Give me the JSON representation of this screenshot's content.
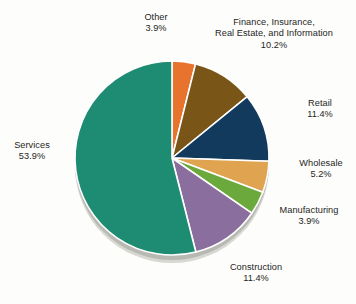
{
  "chart_data": {
    "type": "pie",
    "title": "",
    "subtitle": "",
    "xlabel": "",
    "ylabel": "",
    "legend_position": "none",
    "grid": false,
    "value_suffix": "%",
    "total": 99.9,
    "start_angle_deg": 0,
    "direction": "clockwise",
    "categories": [
      "Other",
      "Finance, Insurance, Real Estate, and Information",
      "Retail",
      "Wholesale",
      "Manufacturing",
      "Construction",
      "Services"
    ],
    "values": [
      3.9,
      10.2,
      11.4,
      5.2,
      3.9,
      11.4,
      53.9
    ],
    "colors": [
      "#e8732e",
      "#7a5518",
      "#123a5c",
      "#e0a450",
      "#6ca93c",
      "#8a6e9e",
      "#1e8c72"
    ],
    "slices": [
      {
        "id": "other",
        "name": "Other",
        "label_line1": "Other",
        "label_line2": "3.9%",
        "value": 3.9,
        "color": "#e8732e"
      },
      {
        "id": "finance",
        "name": "Finance, Insurance, Real Estate, and Information",
        "label_line1": "Finance, Insurance,",
        "label_line2": "Real Estate, and Information",
        "label_line3": "10.2%",
        "value": 10.2,
        "color": "#7a5518"
      },
      {
        "id": "retail",
        "name": "Retail",
        "label_line1": "Retail",
        "label_line2": "11.4%",
        "value": 11.4,
        "color": "#123a5c"
      },
      {
        "id": "wholesale",
        "name": "Wholesale",
        "label_line1": "Wholesale",
        "label_line2": "5.2%",
        "value": 5.2,
        "color": "#e0a450"
      },
      {
        "id": "manufacturing",
        "name": "Manufacturing",
        "label_line1": "Manufacturing",
        "label_line2": "3.9%",
        "value": 3.9,
        "color": "#6ca93c"
      },
      {
        "id": "construction",
        "name": "Construction",
        "label_line1": "Construction",
        "label_line2": "11.4%",
        "value": 11.4,
        "color": "#8a6e9e"
      },
      {
        "id": "services",
        "name": "Services",
        "label_line1": "Services",
        "label_line2": "53.9%",
        "value": 53.9,
        "color": "#1e8c72"
      }
    ]
  },
  "style": {
    "background": "#fdfdfb",
    "text_color": "#252525",
    "separator_color": "#ffffff",
    "rim_color": "#b9b9b4",
    "rim_shadow_color": "#d8d8d2"
  },
  "geometry": {
    "center_x": 172,
    "center_y": 158,
    "radius": 97,
    "depth": 8
  }
}
